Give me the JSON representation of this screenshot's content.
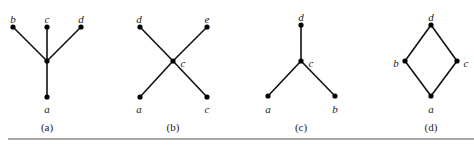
{
  "figure": {
    "diagrams": [
      {
        "caption": "(a)",
        "nodes": [
          {
            "id": "b",
            "label": "b",
            "x": 13,
            "y": 27,
            "lx": 13,
            "ly": 20
          },
          {
            "id": "c",
            "label": "c",
            "x": 47,
            "y": 27,
            "lx": 47,
            "ly": 20
          },
          {
            "id": "d",
            "label": "d",
            "x": 81,
            "y": 27,
            "lx": 81,
            "ly": 20
          },
          {
            "id": "m",
            "label": "",
            "x": 47,
            "y": 61,
            "lx": 47,
            "ly": 61
          },
          {
            "id": "a",
            "label": "a",
            "x": 47,
            "y": 97,
            "lx": 47,
            "ly": 110
          }
        ],
        "edges": [
          [
            "b",
            "m"
          ],
          [
            "c",
            "m"
          ],
          [
            "d",
            "m"
          ],
          [
            "m",
            "a"
          ]
        ],
        "caption_x": 47
      },
      {
        "caption": "(b)",
        "nodes": [
          {
            "id": "d",
            "label": "d",
            "x": 140,
            "y": 27,
            "lx": 139,
            "ly": 20
          },
          {
            "id": "e",
            "label": "e",
            "x": 207,
            "y": 27,
            "lx": 207,
            "ly": 20
          },
          {
            "id": "c",
            "label": "c",
            "x": 173,
            "y": 61,
            "lx": 183,
            "ly": 64
          },
          {
            "id": "a",
            "label": "a",
            "x": 140,
            "y": 97,
            "lx": 139,
            "ly": 110
          },
          {
            "id": "c2",
            "label": "c",
            "x": 207,
            "y": 97,
            "lx": 207,
            "ly": 110
          }
        ],
        "edges": [
          [
            "d",
            "c"
          ],
          [
            "e",
            "c"
          ],
          [
            "c",
            "a"
          ],
          [
            "c",
            "c2"
          ]
        ],
        "caption_x": 173
      },
      {
        "caption": "(c)",
        "nodes": [
          {
            "id": "d",
            "label": "d",
            "x": 301,
            "y": 25,
            "lx": 301,
            "ly": 18
          },
          {
            "id": "c",
            "label": "c",
            "x": 301,
            "y": 61,
            "lx": 311,
            "ly": 64
          },
          {
            "id": "a",
            "label": "a",
            "x": 268,
            "y": 96,
            "lx": 268,
            "ly": 110
          },
          {
            "id": "b",
            "label": "b",
            "x": 335,
            "y": 96,
            "lx": 335,
            "ly": 110
          }
        ],
        "edges": [
          [
            "d",
            "c"
          ],
          [
            "c",
            "a"
          ],
          [
            "c",
            "b"
          ]
        ],
        "caption_x": 301
      },
      {
        "caption": "(d)",
        "nodes": [
          {
            "id": "d",
            "label": "d",
            "x": 431,
            "y": 25,
            "lx": 431,
            "ly": 18
          },
          {
            "id": "b",
            "label": "b",
            "x": 405,
            "y": 61,
            "lx": 396,
            "ly": 64
          },
          {
            "id": "c",
            "label": "c",
            "x": 457,
            "y": 61,
            "lx": 466,
            "ly": 64
          },
          {
            "id": "a",
            "label": "a",
            "x": 431,
            "y": 96,
            "lx": 431,
            "ly": 110
          }
        ],
        "edges": [
          [
            "d",
            "b"
          ],
          [
            "d",
            "c"
          ],
          [
            "b",
            "a"
          ],
          [
            "c",
            "a"
          ]
        ],
        "caption_x": 431
      }
    ],
    "caption_y": 131,
    "rule": {
      "x1": 8,
      "x2": 474,
      "y": 139
    }
  }
}
